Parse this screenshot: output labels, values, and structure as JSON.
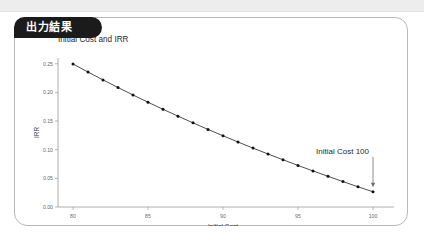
{
  "window": {
    "top_band": true
  },
  "panel": {
    "tab_label": "出力結果"
  },
  "chart_data": {
    "type": "line",
    "title": "Initial Cost and IRR",
    "xlabel": "Initial Cost",
    "ylabel": "IRR",
    "xlim": [
      79,
      101
    ],
    "ylim": [
      0.0,
      0.26
    ],
    "grid": false,
    "legend": null,
    "marker": "filled-circle",
    "x_ticks": [
      80,
      85,
      90,
      95,
      100
    ],
    "x_tick_labels": [
      "80",
      "85",
      "90",
      "95",
      "100"
    ],
    "y_ticks": [
      0.0,
      0.05,
      0.1,
      0.15,
      0.2,
      0.25
    ],
    "y_tick_labels": [
      "0.00",
      "0.05",
      "0.10",
      "0.15",
      "0.20",
      "0.25"
    ],
    "x": [
      80,
      81,
      82,
      83,
      84,
      85,
      86,
      87,
      88,
      89,
      90,
      91,
      92,
      93,
      94,
      95,
      96,
      97,
      98,
      99,
      100
    ],
    "values": [
      0.2495,
      0.2355,
      0.2218,
      0.2085,
      0.1955,
      0.1828,
      0.1705,
      0.1585,
      0.1468,
      0.1354,
      0.1243,
      0.1134,
      0.1028,
      0.0925,
      0.0824,
      0.0725,
      0.0629,
      0.0535,
      0.0443,
      0.0353,
      0.0265
    ],
    "annotations": [
      {
        "text": "Initial Cost 100",
        "points_to_x": 100,
        "points_to_y": 0.0265,
        "arrow": "down"
      }
    ]
  }
}
